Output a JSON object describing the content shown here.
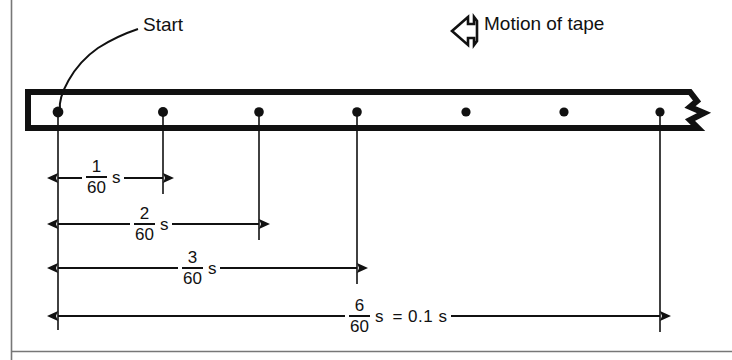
{
  "figure": {
    "background_color": "#ffffff",
    "ink_color": "#111111",
    "width": 732,
    "height": 360
  },
  "annotations": {
    "start_label": "Start",
    "motion_label": "Motion of tape",
    "motion_arrow_icon": "left-arrow-outline-icon"
  },
  "tape": {
    "name": "ticker-tape",
    "dot_count": 7,
    "dot_positions_px": [
      58,
      163,
      259,
      357,
      466,
      564,
      660
    ],
    "torn_edge": "zigzag"
  },
  "dimensions": [
    {
      "id": "d1",
      "numerator": "1",
      "denominator": "60",
      "unit": "s",
      "equals": "",
      "from_dot": 0,
      "to_dot": 1,
      "x_start": 58,
      "x_end": 163,
      "y": 178
    },
    {
      "id": "d2",
      "numerator": "2",
      "denominator": "60",
      "unit": "s",
      "equals": "",
      "from_dot": 0,
      "to_dot": 2,
      "x_start": 58,
      "x_end": 259,
      "y": 224
    },
    {
      "id": "d3",
      "numerator": "3",
      "denominator": "60",
      "unit": "s",
      "equals": "",
      "from_dot": 0,
      "to_dot": 3,
      "x_start": 58,
      "x_end": 357,
      "y": 268
    },
    {
      "id": "d6",
      "numerator": "6",
      "denominator": "60",
      "unit": "s",
      "equals": "= 0.1 s",
      "from_dot": 0,
      "to_dot": 6,
      "x_start": 58,
      "x_end": 660,
      "y": 316
    }
  ]
}
